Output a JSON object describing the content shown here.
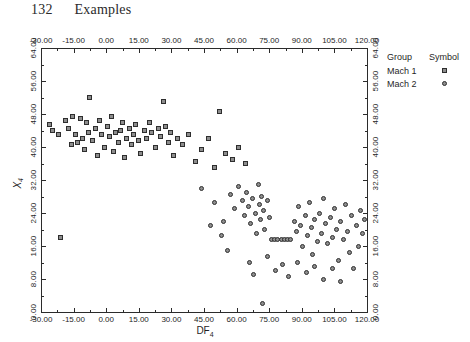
{
  "page": {
    "number": "132",
    "header_title": "Examples"
  },
  "chart_data": {
    "type": "scatter",
    "title": "",
    "xlabel": "DF4",
    "ylabel": "X4",
    "xlabel_base": "DF",
    "xlabel_sub": "4",
    "ylabel_base": "X",
    "ylabel_sub": "4",
    "xlim": [
      -30.0,
      120.0
    ],
    "ylim": [
      0.0,
      64.0
    ],
    "xticks": [
      -30.0,
      -15.0,
      0.0,
      15.0,
      30.0,
      45.0,
      60.0,
      75.0,
      90.0,
      105.0,
      120.0
    ],
    "yticks": [
      0.0,
      8.0,
      16.0,
      24.0,
      32.0,
      40.0,
      48.0,
      56.0,
      64.0
    ],
    "xtick_labels": [
      "-30.00",
      "-15.00",
      "0.00",
      "15.00",
      "30.00",
      "45.00",
      "60.00",
      "75.00",
      "90.00",
      "105.00",
      "120.00"
    ],
    "ytick_labels": [
      "0.00",
      "8.00",
      "16.00",
      "24.00",
      "32.00",
      "40.00",
      "48.00",
      "56.00",
      "64.00"
    ],
    "axes_mirrored": true,
    "grid": false,
    "legend_position": "right-outside",
    "legend_title_group": "Group",
    "legend_title_symbol": "Symbol",
    "series": [
      {
        "name": "Mach 1",
        "marker": "square",
        "color": "#8d8d8d",
        "edge_color": "#2e2e2e",
        "points": [
          [
            -26.0,
            45.5
          ],
          [
            -24.5,
            44.0
          ],
          [
            -22.0,
            43.0
          ],
          [
            -21.0,
            18.0
          ],
          [
            -18.5,
            46.5
          ],
          [
            -17.5,
            44.5
          ],
          [
            -16.0,
            40.5
          ],
          [
            -15.5,
            47.5
          ],
          [
            -14.0,
            43.0
          ],
          [
            -13.0,
            41.0
          ],
          [
            -12.0,
            47.0
          ],
          [
            -11.0,
            42.0
          ],
          [
            -10.0,
            39.5
          ],
          [
            -9.0,
            46.0
          ],
          [
            -8.0,
            43.5
          ],
          [
            -7.5,
            52.0
          ],
          [
            -6.5,
            41.5
          ],
          [
            -5.0,
            44.5
          ],
          [
            -4.0,
            38.0
          ],
          [
            -3.0,
            46.5
          ],
          [
            -2.0,
            43.0
          ],
          [
            -1.0,
            40.0
          ],
          [
            0.5,
            45.0
          ],
          [
            1.5,
            42.5
          ],
          [
            2.5,
            47.5
          ],
          [
            3.5,
            39.0
          ],
          [
            4.5,
            43.5
          ],
          [
            5.5,
            41.0
          ],
          [
            6.5,
            44.0
          ],
          [
            7.5,
            46.0
          ],
          [
            8.5,
            37.5
          ],
          [
            9.5,
            42.0
          ],
          [
            10.5,
            44.5
          ],
          [
            11.5,
            40.5
          ],
          [
            12.5,
            43.0
          ],
          [
            13.5,
            45.5
          ],
          [
            15.0,
            41.5
          ],
          [
            16.0,
            38.5
          ],
          [
            17.5,
            44.0
          ],
          [
            18.5,
            42.0
          ],
          [
            20.0,
            46.0
          ],
          [
            21.0,
            43.5
          ],
          [
            22.5,
            40.0
          ],
          [
            24.0,
            44.5
          ],
          [
            25.0,
            42.5
          ],
          [
            26.5,
            51.0
          ],
          [
            27.5,
            45.0
          ],
          [
            28.5,
            41.0
          ],
          [
            29.5,
            43.5
          ],
          [
            31.0,
            38.0
          ],
          [
            33.0,
            42.0
          ],
          [
            35.0,
            40.5
          ],
          [
            38.0,
            43.0
          ],
          [
            41.0,
            36.5
          ],
          [
            44.0,
            39.5
          ],
          [
            47.0,
            42.0
          ],
          [
            50.0,
            35.0
          ],
          [
            52.0,
            48.5
          ],
          [
            55.0,
            38.5
          ],
          [
            58.0,
            37.0
          ],
          [
            61.0,
            40.0
          ],
          [
            64.0,
            36.0
          ]
        ]
      },
      {
        "name": "Mach 2",
        "marker": "circle",
        "color": "#8d8d8d",
        "edge_color": "#2e2e2e",
        "points": [
          [
            44.0,
            30.0
          ],
          [
            50.0,
            26.5
          ],
          [
            54.0,
            22.0
          ],
          [
            57.0,
            28.5
          ],
          [
            59.0,
            25.0
          ],
          [
            61.0,
            30.5
          ],
          [
            62.5,
            27.0
          ],
          [
            63.5,
            23.5
          ],
          [
            64.5,
            29.0
          ],
          [
            65.5,
            25.5
          ],
          [
            66.5,
            21.5
          ],
          [
            67.5,
            27.5
          ],
          [
            68.5,
            24.0
          ],
          [
            69.0,
            19.0
          ],
          [
            70.0,
            31.0
          ],
          [
            70.5,
            26.0
          ],
          [
            71.0,
            22.5
          ],
          [
            71.5,
            28.0
          ],
          [
            72.0,
            2.0
          ],
          [
            72.5,
            24.5
          ],
          [
            73.0,
            20.0
          ],
          [
            74.0,
            27.0
          ],
          [
            75.0,
            23.0
          ],
          [
            76.0,
            17.5
          ],
          [
            77.5,
            17.5
          ],
          [
            79.0,
            17.5
          ],
          [
            80.5,
            17.5
          ],
          [
            82.0,
            17.5
          ],
          [
            83.5,
            17.5
          ],
          [
            85.0,
            17.5
          ],
          [
            86.5,
            22.0
          ],
          [
            87.5,
            19.5
          ],
          [
            88.5,
            25.5
          ],
          [
            89.5,
            21.0
          ],
          [
            90.5,
            16.0
          ],
          [
            91.5,
            23.5
          ],
          [
            92.5,
            18.5
          ],
          [
            93.5,
            26.5
          ],
          [
            94.5,
            20.5
          ],
          [
            95.0,
            14.0
          ],
          [
            96.0,
            22.5
          ],
          [
            97.0,
            17.0
          ],
          [
            98.0,
            24.0
          ],
          [
            99.0,
            19.0
          ],
          [
            100.0,
            27.5
          ],
          [
            101.0,
            21.5
          ],
          [
            102.0,
            16.5
          ],
          [
            103.0,
            23.0
          ],
          [
            104.0,
            18.0
          ],
          [
            105.0,
            25.0
          ],
          [
            106.0,
            20.0
          ],
          [
            107.0,
            12.5
          ],
          [
            108.0,
            22.0
          ],
          [
            109.0,
            17.5
          ],
          [
            110.0,
            26.0
          ],
          [
            111.0,
            19.5
          ],
          [
            112.0,
            14.5
          ],
          [
            113.0,
            23.5
          ],
          [
            114.0,
            10.5
          ],
          [
            115.0,
            21.0
          ],
          [
            116.0,
            16.0
          ],
          [
            117.0,
            24.5
          ],
          [
            118.0,
            19.0
          ],
          [
            119.0,
            22.5
          ],
          [
            66.0,
            12.0
          ],
          [
            68.0,
            9.0
          ],
          [
            74.0,
            13.5
          ],
          [
            78.0,
            10.0
          ],
          [
            81.0,
            11.5
          ],
          [
            84.0,
            8.5
          ],
          [
            88.0,
            12.0
          ],
          [
            92.0,
            9.5
          ],
          [
            96.0,
            11.0
          ],
          [
            100.0,
            8.0
          ],
          [
            104.0,
            10.5
          ],
          [
            108.0,
            7.5
          ],
          [
            48.0,
            21.0
          ],
          [
            53.0,
            18.5
          ],
          [
            56.0,
            15.0
          ]
        ]
      }
    ]
  }
}
